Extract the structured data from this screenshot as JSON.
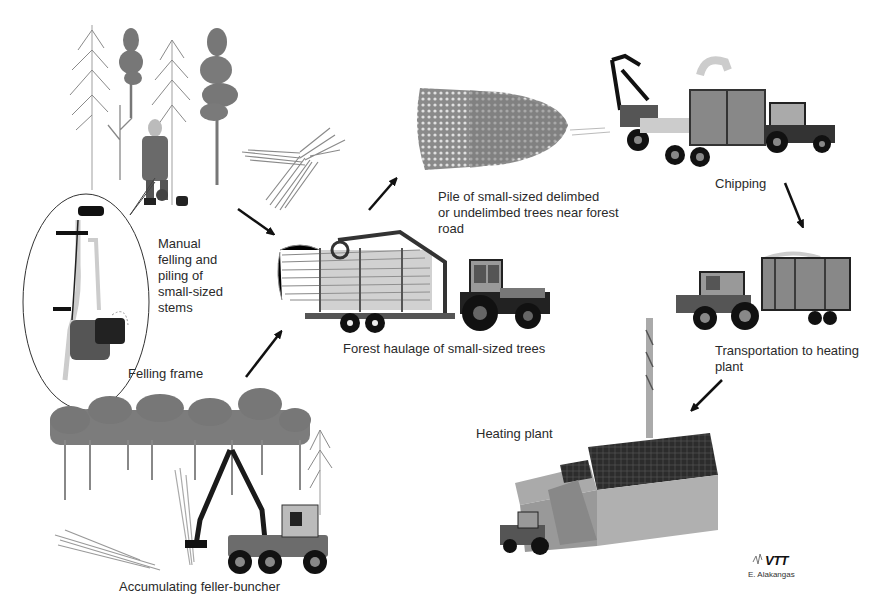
{
  "diagram": {
    "type": "process-flow",
    "steps": [
      {
        "id": "manual",
        "label": "Manual\nfelling and\npiling of\nsmall-sized\nstems",
        "lines": [
          "Manual",
          "felling and",
          "piling of",
          "small-sized",
          "stems"
        ]
      },
      {
        "id": "frame",
        "label": "Felling frame"
      },
      {
        "id": "buncher",
        "label": "Accumulating feller-buncher"
      },
      {
        "id": "haulage",
        "label": "Forest haulage of small-sized trees"
      },
      {
        "id": "pile",
        "label": "Pile of small-sized delimbed or undelimbed trees near forest road",
        "lines": [
          "Pile of small-sized delimbed",
          "or undelimbed trees near forest",
          "road"
        ]
      },
      {
        "id": "chipping",
        "label": "Chipping"
      },
      {
        "id": "transport",
        "label": "Transportation to heating plant",
        "lines": [
          "Transportation to heating",
          "plant"
        ]
      },
      {
        "id": "plant",
        "label": "Heating plant"
      }
    ],
    "arrows": [
      {
        "from": "manual",
        "to": "haulage"
      },
      {
        "from": "buncher",
        "to": "haulage"
      },
      {
        "from": "haulage",
        "to": "pile"
      },
      {
        "from": "chipping",
        "to": "transport"
      },
      {
        "from": "transport",
        "to": "plant"
      }
    ],
    "logo": "VTT",
    "credit": "E. Alakangas"
  },
  "colors": {
    "background": "#ffffff",
    "text": "#2a2a2a",
    "dark": "#1a1a1a",
    "mid_gray": "#6e6e6e",
    "light_gray": "#a8a8a8",
    "foliage": "#7a7a7a"
  }
}
